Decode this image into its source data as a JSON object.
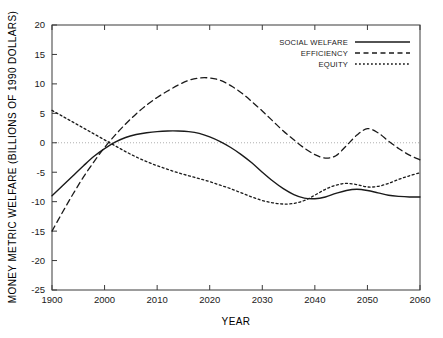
{
  "chart_data": {
    "type": "line",
    "title": "",
    "xlabel": "YEAR",
    "ylabel": "MONEY METRIC WELFARE (BILLIONS OF 1990 DOLLARS)",
    "xlim": [
      1990,
      2060
    ],
    "ylim": [
      -25,
      20
    ],
    "xticks": [
      1990,
      2000,
      2010,
      2020,
      2030,
      2040,
      2050,
      2060
    ],
    "xticklabels": [
      "1900",
      "2000",
      "2010",
      "2020",
      "2030",
      "2040",
      "2050",
      "2060"
    ],
    "yticks": [
      20,
      15,
      10,
      5,
      0,
      -5,
      -10,
      -15,
      -20,
      -25
    ],
    "yticklabels": [
      "20",
      "15",
      "10",
      "5",
      "0",
      "-5",
      "-10",
      "-15",
      "-20",
      "-25"
    ],
    "grid": false,
    "zero_line": true,
    "legend_position": "top-right",
    "x": [
      1990,
      1992,
      1994,
      1996,
      1998,
      2000,
      2002,
      2004,
      2006,
      2008,
      2010,
      2012,
      2014,
      2016,
      2018,
      2020,
      2022,
      2024,
      2026,
      2028,
      2030,
      2032,
      2034,
      2036,
      2038,
      2040,
      2042,
      2044,
      2046,
      2048,
      2050,
      2052,
      2054,
      2056,
      2058,
      2060
    ],
    "series": [
      {
        "name": "SOCIAL WELFARE",
        "style": "solid",
        "values": [
          -9.0,
          -7.3,
          -5.6,
          -3.9,
          -2.3,
          -1.0,
          0.1,
          0.9,
          1.4,
          1.7,
          1.9,
          2.0,
          2.0,
          1.9,
          1.6,
          1.0,
          0.2,
          -0.8,
          -2.0,
          -3.4,
          -5.0,
          -6.5,
          -7.8,
          -8.8,
          -9.4,
          -9.5,
          -9.2,
          -8.6,
          -8.1,
          -7.9,
          -8.1,
          -8.5,
          -8.9,
          -9.1,
          -9.2,
          -9.2
        ]
      },
      {
        "name": "EFFICIENCY",
        "style": "dashed",
        "values": [
          -15.0,
          -11.8,
          -8.7,
          -5.8,
          -3.2,
          -0.8,
          1.3,
          3.2,
          4.9,
          6.4,
          7.7,
          8.8,
          9.8,
          10.6,
          11.0,
          11.0,
          10.6,
          9.7,
          8.5,
          7.0,
          5.4,
          3.7,
          2.0,
          0.5,
          -0.9,
          -2.0,
          -2.6,
          -2.2,
          -0.5,
          1.3,
          2.4,
          1.7,
          0.3,
          -1.0,
          -2.1,
          -2.9
        ]
      },
      {
        "name": "EQUITY",
        "style": "dotted",
        "values": [
          5.5,
          4.5,
          3.5,
          2.5,
          1.5,
          0.5,
          -0.5,
          -1.5,
          -2.4,
          -3.2,
          -3.9,
          -4.5,
          -5.1,
          -5.6,
          -6.1,
          -6.6,
          -7.2,
          -7.8,
          -8.5,
          -9.2,
          -9.8,
          -10.2,
          -10.4,
          -10.3,
          -9.8,
          -8.9,
          -7.9,
          -7.2,
          -6.9,
          -7.1,
          -7.5,
          -7.4,
          -6.9,
          -6.2,
          -5.6,
          -5.1
        ]
      }
    ],
    "legend": [
      {
        "label": "SOCIAL WELFARE",
        "style": "solid"
      },
      {
        "label": "EFFICIENCY",
        "style": "dashed"
      },
      {
        "label": "EQUITY",
        "style": "dotted"
      }
    ]
  }
}
